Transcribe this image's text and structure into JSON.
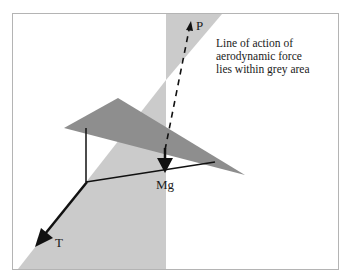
{
  "diagram": {
    "caption_lines": [
      "Line of action of",
      "aerodynamic force",
      "lies within grey area"
    ],
    "labels": {
      "lift_force": "P",
      "weight": "Mg",
      "tension": "T"
    },
    "colors": {
      "frame": "#b4b4b4",
      "grey_area": "#cbcbcb",
      "wing": "#8e8e8e",
      "lines": "#111111"
    }
  }
}
